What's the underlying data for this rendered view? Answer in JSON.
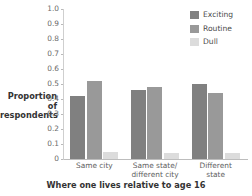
{
  "chart_data": {
    "type": "bar",
    "title": "",
    "xlabel": "Where one lives relative to age 16",
    "ylabel": "Proportion of respondents",
    "categories": [
      "Same city",
      "Same state/ different city",
      "Different state"
    ],
    "category_lines": [
      [
        "Same city"
      ],
      [
        "Same state/",
        "different city"
      ],
      [
        "Different",
        "state"
      ]
    ],
    "series": [
      {
        "name": "Exciting",
        "color": "#808080",
        "values": [
          0.42,
          0.46,
          0.5
        ]
      },
      {
        "name": "Routine",
        "color": "#999999",
        "values": [
          0.52,
          0.48,
          0.44
        ]
      },
      {
        "name": "Dull",
        "color": "#dcdcdc",
        "values": [
          0.05,
          0.04,
          0.04
        ]
      }
    ],
    "ylim": [
      0,
      1.0
    ],
    "ytick_values": [
      1.0,
      0.9,
      0.8,
      0.7,
      0.6,
      0.5,
      0.4,
      0.3,
      0.2,
      0.1,
      0
    ],
    "ytick_labels": [
      "1.0",
      "0.9",
      "0.8",
      "0.7",
      "0.6",
      "0.5",
      "0.4",
      "0.3",
      "0.2",
      "0.1",
      "0"
    ],
    "grid": false,
    "legend_position": "top-right",
    "legend_entries": [
      "Exciting",
      "Routine",
      "Dull"
    ]
  },
  "axis": {
    "ylabel_line1": "Proportion of",
    "ylabel_line2": "respondents",
    "xlabel": "Where one lives relative to age 16"
  },
  "legend": {
    "items": [
      {
        "label": "Exciting",
        "color": "#808080"
      },
      {
        "label": "Routine",
        "color": "#999999"
      },
      {
        "label": "Dull",
        "color": "#dcdcdc"
      }
    ]
  }
}
